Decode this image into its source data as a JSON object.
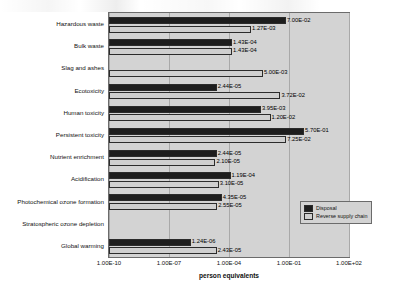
{
  "chart_data": {
    "type": "bar",
    "orientation": "horizontal",
    "title": "",
    "xlabel": "person equivalents",
    "ylabel": "",
    "xscale": "log",
    "xlim": [
      1e-10,
      100.0
    ],
    "xticks": [
      "1.00E-10",
      "1.00E-07",
      "1.00E-04",
      "1.00E-01",
      "1.00E+02"
    ],
    "grid": true,
    "legend_position": "inside-right",
    "categories": [
      "Hazardous waste",
      "Bulk waste",
      "Slag and ashes",
      "Ecotoxicity",
      "Human toxicity",
      "Persistent toxicity",
      "Nutrient enrichment",
      "Acidification",
      "Photochemical ozone formation",
      "Stratospheric ozone depletion",
      "Global warming"
    ],
    "series": [
      {
        "name": "Disposal",
        "color": "#1d1d1d",
        "values": [
          0.07,
          0.000143,
          null,
          2.44e-05,
          0.00395,
          0.57,
          2.44e-05,
          0.000119,
          4.35e-05,
          null,
          1.24e-06
        ],
        "labels": [
          "7.00E-02",
          "1.43E-04",
          "",
          "2.44E-05",
          "3.95E-03",
          "5.70E-01",
          "2.44E-05",
          "1.19E-04",
          "4.35E-05",
          "",
          "1.24E-06"
        ]
      },
      {
        "name": "Reverse supply chain",
        "color": "#cfcfcf",
        "values": [
          0.00127,
          0.000143,
          0.005,
          0.0372,
          0.012,
          0.0725,
          2.1e-05,
          3.1e-05,
          2.55e-05,
          null,
          2.43e-05
        ],
        "labels": [
          "1.27E-03",
          "1.43E-04",
          "5.00E-03",
          "3.72E-02",
          "1.20E-02",
          "7.25E-02",
          "2.10E-05",
          "3.10E-05",
          "2.55E-05",
          "",
          "2.43E-05"
        ]
      }
    ]
  },
  "legend": {
    "items": [
      {
        "label": "Disposal"
      },
      {
        "label": "Reverse supply chain"
      }
    ]
  }
}
